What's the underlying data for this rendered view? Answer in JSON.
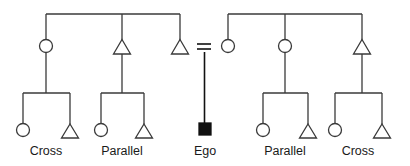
{
  "diagram": {
    "type": "kinship-diagram",
    "width": 410,
    "height": 166,
    "background_color": "#ffffff",
    "line_color": "#3a3a3a",
    "text_color": "#1a1a1a",
    "ego_fill_color": "#111111",
    "symbol_legend": {
      "circle": "female",
      "triangle": "male",
      "filled-square": "ego",
      "equals-sign": "marriage-union"
    },
    "labels": [
      {
        "id": "label-cross-left",
        "text": "Cross",
        "x": 46,
        "y": 155
      },
      {
        "id": "label-parallel-left",
        "text": "Parallel",
        "x": 122,
        "y": 155
      },
      {
        "id": "label-ego",
        "text": "Ego",
        "x": 205,
        "y": 155
      },
      {
        "id": "label-parallel-right",
        "text": "Parallel",
        "x": 285,
        "y": 155
      },
      {
        "id": "label-cross-right",
        "text": "Cross",
        "x": 358,
        "y": 155
      }
    ],
    "generation1": {
      "left_sibling_bar": {
        "x1": 46,
        "x2": 180,
        "y": 14
      },
      "right_sibling_bar": {
        "x1": 228,
        "x2": 362,
        "y": 14
      },
      "nodes": [
        {
          "id": "g1-left-female",
          "symbol": "circle",
          "x": 46,
          "y": 46,
          "side": "left"
        },
        {
          "id": "g1-left-male",
          "symbol": "triangle",
          "x": 122,
          "y": 47,
          "side": "left"
        },
        {
          "id": "g1-left-male-2",
          "symbol": "triangle",
          "x": 180,
          "y": 47,
          "side": "left"
        },
        {
          "id": "g1-right-female",
          "symbol": "circle",
          "x": 228,
          "y": 46,
          "side": "right"
        },
        {
          "id": "g1-right-female-2",
          "symbol": "circle",
          "x": 285,
          "y": 46,
          "side": "right"
        },
        {
          "id": "g1-right-male",
          "symbol": "triangle",
          "x": 362,
          "y": 47,
          "side": "right"
        }
      ]
    },
    "union": {
      "id": "marriage-union",
      "equals_x": 204,
      "equals_y_top": 44,
      "equals_y_bottom": 49,
      "equals_half_width": 7,
      "descent_line": {
        "x": 205,
        "y1": 52,
        "y2": 123
      }
    },
    "generation2": {
      "ego": {
        "id": "ego-square",
        "symbol": "filled-square",
        "x": 205,
        "y": 129,
        "size": 12
      },
      "groups": [
        {
          "id": "group-cross-left",
          "parent_x": 46,
          "bar": {
            "x1": 23,
            "x2": 70,
            "y": 93
          },
          "children": [
            {
              "id": "cross-left-female",
              "symbol": "circle",
              "x": 23,
              "y": 130
            },
            {
              "id": "cross-left-male",
              "symbol": "triangle",
              "x": 70,
              "y": 131
            }
          ]
        },
        {
          "id": "group-parallel-left",
          "parent_x": 122,
          "bar": {
            "x1": 101,
            "x2": 144,
            "y": 93
          },
          "children": [
            {
              "id": "parallel-left-female",
              "symbol": "circle",
              "x": 101,
              "y": 130
            },
            {
              "id": "parallel-left-male",
              "symbol": "triangle",
              "x": 144,
              "y": 131
            }
          ]
        },
        {
          "id": "group-parallel-right",
          "parent_x": 285,
          "bar": {
            "x1": 263,
            "x2": 308,
            "y": 93
          },
          "children": [
            {
              "id": "parallel-right-female",
              "symbol": "circle",
              "x": 263,
              "y": 130
            },
            {
              "id": "parallel-right-male",
              "symbol": "triangle",
              "x": 308,
              "y": 131
            }
          ]
        },
        {
          "id": "group-cross-right",
          "parent_x": 362,
          "bar": {
            "x1": 335,
            "x2": 382,
            "y": 93
          },
          "children": [
            {
              "id": "cross-right-female",
              "symbol": "circle",
              "x": 335,
              "y": 130
            },
            {
              "id": "cross-right-male",
              "symbol": "triangle",
              "x": 382,
              "y": 131
            }
          ]
        }
      ]
    }
  }
}
